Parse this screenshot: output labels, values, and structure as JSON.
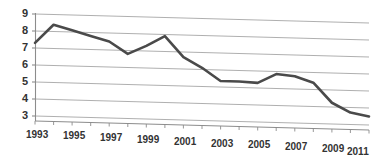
{
  "chart_data": {
    "type": "line",
    "title": "",
    "subtitle": "",
    "xlabel": "",
    "ylabel": "",
    "grid": true,
    "legend": false,
    "legend_position": "none",
    "style": "3d-perspective-line",
    "line_color": "#4a4a4a",
    "grid_color": "#a6a6a6",
    "axis_color": "#8c8c8c",
    "background_color": "#ffffff",
    "xlim": [
      1993,
      2011
    ],
    "ylim": [
      3,
      9
    ],
    "ytick_values": [
      9,
      8,
      7,
      6,
      5,
      4,
      3
    ],
    "ytick_labels": [
      "9",
      "8",
      "7",
      "6",
      "5",
      "4",
      "3"
    ],
    "xtick_labels": [
      "1993",
      "1995",
      "1997",
      "1999",
      "2001",
      "2003",
      "2005",
      "2007",
      "2009",
      "2011"
    ],
    "xtick_values": [
      1993,
      1995,
      1997,
      1999,
      2001,
      2003,
      2005,
      2007,
      2009,
      2011
    ],
    "minor_xticks": [
      1994,
      1996,
      1998,
      2000,
      2002,
      2004,
      2006,
      2008,
      2010
    ],
    "x": [
      1993,
      1994,
      1995,
      1996,
      1997,
      1998,
      1999,
      2000,
      2001,
      2002,
      2003,
      2004,
      2005,
      2006,
      2007,
      2008,
      2009,
      2010,
      2011
    ],
    "values": [
      7.3,
      8.4,
      8.1,
      7.8,
      7.5,
      6.8,
      7.3,
      7.9,
      6.7,
      6.1,
      5.35,
      5.35,
      5.3,
      5.85,
      5.75,
      5.4,
      4.25,
      3.7,
      3.5
    ],
    "series": [
      {
        "name": "",
        "values": [
          7.3,
          8.4,
          8.1,
          7.8,
          7.5,
          6.8,
          7.3,
          7.9,
          6.7,
          6.1,
          5.35,
          5.35,
          5.3,
          5.85,
          5.75,
          5.4,
          4.25,
          3.7,
          3.5
        ]
      }
    ],
    "annotations": []
  }
}
